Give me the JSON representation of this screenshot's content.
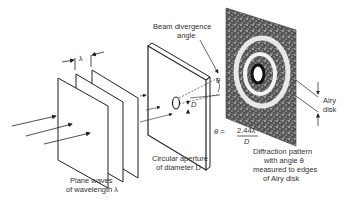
{
  "diagram": {
    "labels": {
      "wavelength_symbol": "λ",
      "beam_divergence_line1": "Beam divergence",
      "beam_divergence_line2": "angle",
      "theta_symbol": "θ",
      "diameter_symbol": "D",
      "airy_line1": "Airy",
      "airy_line2": "disk",
      "plane_waves_line1": "Plane waves",
      "plane_waves_line2": "of wavelength λ",
      "aperture_line1": "Circular aperture",
      "aperture_line2": "of diameter D",
      "formula_lhs": "θ =",
      "formula_numerator": "2.44λ",
      "formula_denominator": "D",
      "pattern_line1": "Diffraction pattern",
      "pattern_line2": "with angle θ",
      "pattern_line3": "measured to edges",
      "pattern_line4": "of Airy disk"
    },
    "components": [
      "plane-waves",
      "circular-aperture",
      "diffraction-pattern-screen",
      "airy-disk"
    ]
  }
}
